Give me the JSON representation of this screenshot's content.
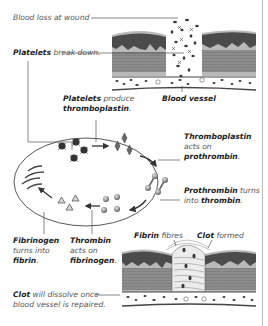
{
  "diagram": {
    "labels": {
      "blood_loss": "Blood loss at wound",
      "platelets_break_bold": "Platelets",
      "platelets_break_rest": "break down.",
      "blood_vessel": "Blood vessel",
      "platelets_produce_bold": "Platelets",
      "platelets_produce_rest": "produce",
      "thromboplastin_line": "thromboplastin",
      "thromboplastin_period": ".",
      "thrombo_acts_bold": "Thromboplastin",
      "thrombo_acts_rest": "acts on",
      "prothrombin_bold": "prothrombin",
      "prothrombin_period": ".",
      "prothrombin_turns_bold": "Prothrombin",
      "prothrombin_turns_rest": "turns",
      "into_text": "into",
      "thrombin_bold": "thrombin",
      "thrombin_period": ".",
      "fibrinogen_bold": "Fibrinogen",
      "fibrinogen_turns": "turns into",
      "fibrin_bold": "fibrin",
      "fibrin_period": ".",
      "thrombin_acts_bold": "Thrombin",
      "thrombin_acts_rest": "acts on",
      "fibrinogen2_bold": "fibrinogen",
      "fibrinogen2_period": ".",
      "fibrin_fibres_bold": "Fibrin",
      "fibrin_fibres_rest": "fibres",
      "clot_formed_bold": "Clot",
      "clot_formed_rest": "formed",
      "clot_dissolve_bold": "Clot",
      "clot_dissolve_rest": "will dissolve once",
      "clot_dissolve_line2": "blood vessel is repaired."
    },
    "cycle_stages": [
      "platelets",
      "thromboplastin",
      "prothrombin",
      "thrombin",
      "fibrinogen",
      "fibrin"
    ],
    "colors": {
      "text": "#333333",
      "bold_text": "#222222",
      "leader_line": "#555555",
      "tissue_dark": "#4a4a4a",
      "tissue_mid": "#8c8c8c",
      "tissue_light": "#b5b5b5",
      "cell": "#3a3a3a",
      "ellipse": "#444444",
      "frame": "#bdbdbd"
    }
  }
}
